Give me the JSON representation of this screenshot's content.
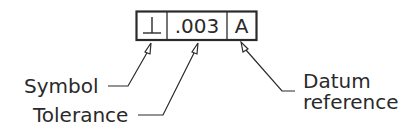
{
  "frame": {
    "symbol": "⊥",
    "tolerance": ".003",
    "datum": "A"
  },
  "callouts": {
    "symbol": "Symbol",
    "tolerance": "Tolerance",
    "datum_line1": "Datum",
    "datum_line2": "reference"
  },
  "colors": {
    "ink": "#2a2a2a",
    "background": "#ffffff"
  }
}
